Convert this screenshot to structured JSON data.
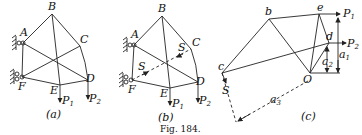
{
  "figure": {
    "caption": "Fig. 184.",
    "panels": [
      {
        "id": "a",
        "label": "(a)",
        "nodes": [
          "A",
          "B",
          "C",
          "D",
          "E",
          "F"
        ],
        "loads": [
          "P1",
          "P2"
        ],
        "supports": [
          "A",
          "F"
        ]
      },
      {
        "id": "b",
        "label": "(b)",
        "nodes": [
          "A",
          "B",
          "C",
          "D",
          "E",
          "F"
        ],
        "loads": [
          "P1",
          "P2"
        ],
        "supports": [
          "A",
          "F"
        ],
        "removed_member_force": "S"
      },
      {
        "id": "c",
        "label": "(c)",
        "points": [
          "b",
          "c",
          "d",
          "e",
          "O"
        ],
        "forces": [
          "P1",
          "P2",
          "S"
        ],
        "arms": [
          "a1",
          "a2",
          "a3"
        ]
      }
    ]
  },
  "labels": {
    "A": "A",
    "B": "B",
    "C": "C",
    "D": "D",
    "E": "E",
    "F": "F",
    "P": "P",
    "one": "1",
    "two": "2",
    "three": "3",
    "S": "S",
    "b": "b",
    "c": "c",
    "d": "d",
    "e": "e",
    "O": "O",
    "a": "a",
    "panel_a": "(a)",
    "panel_b": "(b)",
    "panel_c": "(c)",
    "caption": "Fig. 184."
  }
}
